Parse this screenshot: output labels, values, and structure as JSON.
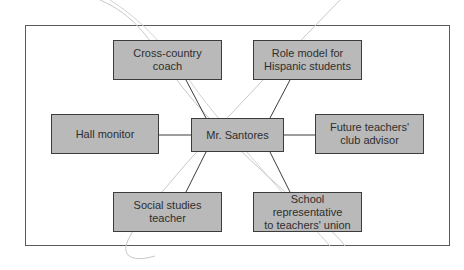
{
  "diagram": {
    "type": "hub-and-spoke role map",
    "center": {
      "label": "Mr. Santores"
    },
    "nodes": [
      {
        "id": "cross-country-coach",
        "label": "Cross-country\ncoach",
        "position": "top-left"
      },
      {
        "id": "role-model",
        "label": "Role model for\nHispanic students",
        "position": "top-right"
      },
      {
        "id": "hall-monitor",
        "label": "Hall monitor",
        "position": "left"
      },
      {
        "id": "future-teachers-advisor",
        "label": "Future teachers'\nclub advisor",
        "position": "right"
      },
      {
        "id": "social-studies-teacher",
        "label": "Social studies\nteacher",
        "position": "bottom-left"
      },
      {
        "id": "school-representative",
        "label": "School representative\nto teachers' union",
        "position": "bottom-right"
      }
    ],
    "edges": [
      {
        "from": "Mr. Santores",
        "to": "Cross-country coach"
      },
      {
        "from": "Mr. Santores",
        "to": "Role model for Hispanic students"
      },
      {
        "from": "Mr. Santores",
        "to": "Hall monitor"
      },
      {
        "from": "Mr. Santores",
        "to": "Future teachers' club advisor"
      },
      {
        "from": "Mr. Santores",
        "to": "Social studies teacher"
      },
      {
        "from": "Mr. Santores",
        "to": "School representative to teachers' union"
      }
    ],
    "colors": {
      "node_fill": "#b9b9b9",
      "node_border": "#3c3c3c",
      "edge": "#3c3c3c",
      "frame": "#5a5a5a",
      "decorative_lines": "#c8c8c8"
    }
  }
}
